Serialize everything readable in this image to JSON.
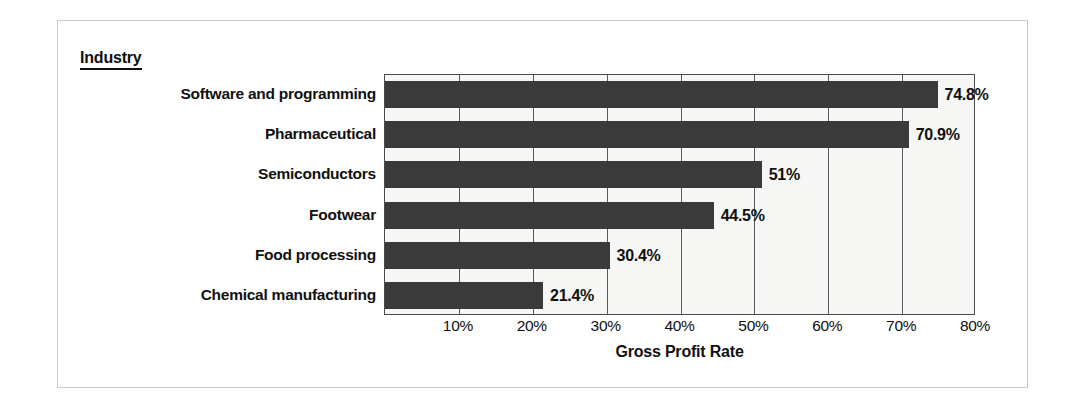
{
  "chart_data": {
    "type": "bar",
    "orientation": "horizontal",
    "title": "",
    "legend_title": "Industry",
    "categories": [
      "Software and programming",
      "Pharmaceutical",
      "Semiconductors",
      "Footwear",
      "Food processing",
      "Chemical manufacturing"
    ],
    "values": [
      74.8,
      70.9,
      51,
      44.5,
      30.4,
      21.4
    ],
    "value_labels": [
      "74.8%",
      "70.9%",
      "51%",
      "44.5%",
      "30.4%",
      "21.4%"
    ],
    "xlabel": "Gross Profit Rate",
    "ylabel": "Industry",
    "xlim": [
      0,
      80
    ],
    "xticks": [
      10,
      20,
      30,
      40,
      50,
      60,
      70,
      80
    ],
    "xtick_labels": [
      "10%",
      "20%",
      "30%",
      "40%",
      "50%",
      "60%",
      "70%",
      "80%"
    ],
    "grid": true,
    "legend_position": "none",
    "colors": {
      "bar": "#3a3a3a",
      "plot_background": "#f7f7f5",
      "axis": "#4a4a4a",
      "gridline": "#5a5a5a",
      "text": "#101010",
      "frame_border": "#c9c9c9",
      "page_background": "#ffffff"
    }
  }
}
